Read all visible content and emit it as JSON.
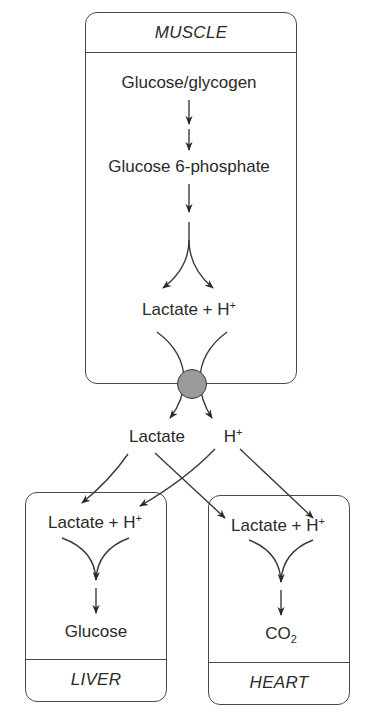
{
  "diagram": {
    "type": "metabolic-flow",
    "colors": {
      "line": "#3a3a3a",
      "box_border": "#4a4a4a",
      "transporter_fill": "#9a9a9a",
      "text": "#2a2a2a"
    }
  },
  "muscle": {
    "label": "MUSCLE",
    "steps": {
      "glucose_glycogen": "Glucose/glycogen",
      "glucose_6_phosphate": "Glucose 6-phosphate",
      "lactate": "Lactate",
      "plus": " + ",
      "h": "H",
      "h_charge": "+"
    }
  },
  "blood": {
    "lactate": "Lactate",
    "h": "H",
    "h_charge": "+"
  },
  "liver": {
    "label": "LIVER",
    "input": {
      "lactate": "Lactate",
      "plus": " + ",
      "h": "H",
      "h_charge": "+"
    },
    "product": "Glucose"
  },
  "heart": {
    "label": "HEART",
    "input": {
      "lactate": "Lactate",
      "plus": " + ",
      "h": "H",
      "h_charge": "+"
    },
    "product": {
      "base": "CO",
      "subscript": "2"
    }
  }
}
